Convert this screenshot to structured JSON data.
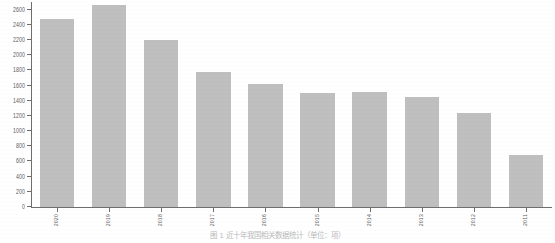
{
  "chart_data": {
    "type": "bar",
    "title": "",
    "subtitle": "",
    "xlabel": "",
    "ylabel": "",
    "categories": [
      "2020",
      "2019",
      "2018",
      "2017",
      "2016",
      "2015",
      "2014",
      "2013",
      "2012",
      "2011"
    ],
    "values": [
      2480,
      2660,
      2200,
      1780,
      1620,
      1500,
      1510,
      1450,
      1240,
      680
    ],
    "ylim": [
      0,
      2700
    ],
    "yticks": [
      0,
      200,
      400,
      600,
      800,
      1000,
      1200,
      1400,
      1600,
      1800,
      2000,
      2200,
      2400,
      2600
    ],
    "ytick_labels": [
      "0",
      "200",
      "400",
      "600",
      "800",
      "1000",
      "1200",
      "1400",
      "1600",
      "1800",
      "2000",
      "2200",
      "2400",
      "2600"
    ],
    "grid": false,
    "legend": null,
    "legend_position": "none",
    "bar_color": "#bfbfbf",
    "axis_color": "#6e6e6e",
    "text_color": "#5a5a5a",
    "background": "#ffffff"
  },
  "caption": {
    "text": "图 1 近十年我国相关数据统计（单位：项）"
  }
}
